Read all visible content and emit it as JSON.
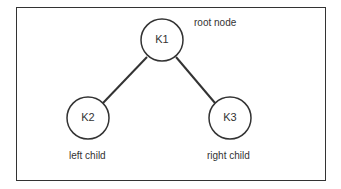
{
  "diagram": {
    "type": "binary-tree",
    "nodes": [
      {
        "id": "K1",
        "label": "K1",
        "annotation": "root node"
      },
      {
        "id": "K2",
        "label": "K2",
        "annotation": "left child"
      },
      {
        "id": "K3",
        "label": "K3",
        "annotation": "right child"
      }
    ],
    "edges": [
      {
        "from": "K1",
        "to": "K2"
      },
      {
        "from": "K1",
        "to": "K3"
      }
    ],
    "colors": {
      "stroke": "#333333",
      "background": "#ffffff"
    }
  }
}
